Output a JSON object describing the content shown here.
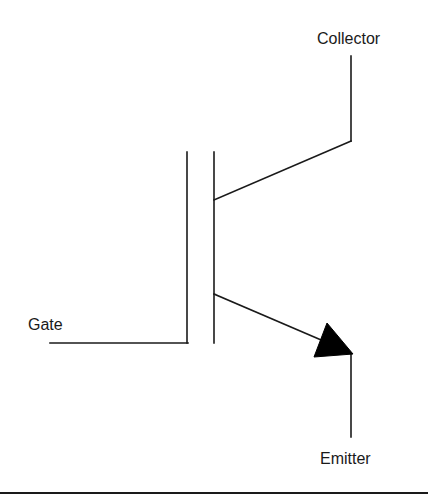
{
  "diagram": {
    "labels": {
      "collector": "Collector",
      "gate": "Gate",
      "emitter": "Emitter"
    },
    "colors": {
      "stroke": "#1a1a1a",
      "background": "#ffffff"
    },
    "geometry": {
      "gate_lead": {
        "x1": 50,
        "y1": 343,
        "x2": 188,
        "y2": 343
      },
      "gate_plate": {
        "x1": 187,
        "y1": 152,
        "x2": 187,
        "y2": 343
      },
      "channel_bar": {
        "x1": 214,
        "y1": 152,
        "x2": 214,
        "y2": 343
      },
      "collector_diag": {
        "x1": 214,
        "y1": 200,
        "x2": 351,
        "y2": 141
      },
      "collector_lead": {
        "x1": 351,
        "y1": 141,
        "x2": 351,
        "y2": 56
      },
      "emitter_diag": {
        "x1": 214,
        "y1": 294,
        "x2": 335,
        "y2": 346
      },
      "emitter_arrow": "327,323 352,354 314,357",
      "emitter_lead": {
        "x1": 351,
        "y1": 354,
        "x2": 351,
        "y2": 437
      }
    }
  }
}
